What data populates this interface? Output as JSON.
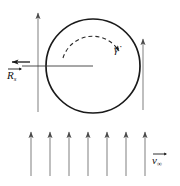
{
  "figure": {
    "background_color": "#ffffff",
    "stroke_color": "#1a1a1a",
    "arrow_color": "#6e6e6e",
    "width": 180,
    "height": 186
  },
  "labels": {
    "radius": {
      "symbol": "R",
      "subscript": "s",
      "text": "R"
    },
    "velocity": {
      "symbol": "v",
      "subscript": "∞",
      "text": "v"
    },
    "shear_rate": {
      "symbol": "γ",
      "text": "γ̇",
      "dot": "˙"
    }
  },
  "elements": {
    "circle": {
      "name": "cylinder-cross-section",
      "center_x": 93,
      "center_y": 66,
      "radius": 47,
      "stroke_width": 1.6,
      "fill": "none"
    },
    "radius_line": {
      "name": "radius-line",
      "from_x": 93,
      "from_y": 66,
      "to_x": 22,
      "to_y": 66
    },
    "radius_arrow": {
      "name": "radius-direction-arrow",
      "x1": 30,
      "y1": 62,
      "x2": 12,
      "y2": 62,
      "direction": "left"
    },
    "rotation_arc": {
      "name": "rotation-arc-arrow",
      "dash": "4,3",
      "start_angle_deg": 195,
      "end_angle_deg": 340,
      "arc_radius": 31,
      "direction": "clockwise"
    },
    "tall_left_arrow": {
      "name": "flow-arrow-left-tall",
      "x": 38,
      "y_bottom": 112,
      "y_top": 12
    },
    "right_arrow": {
      "name": "flow-arrow-right",
      "x": 143,
      "y_bottom": 110,
      "y_top": 38
    }
  },
  "flow_field": {
    "name": "uniform-flow-arrow-row",
    "count": 7,
    "y_bottom": 176,
    "y_top": 131,
    "x_positions": [
      31,
      50,
      69,
      88,
      107,
      126,
      145
    ]
  }
}
